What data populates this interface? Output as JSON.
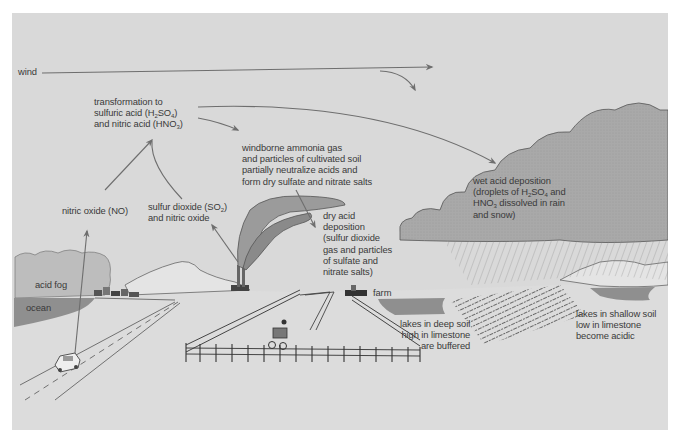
{
  "diagram": {
    "title": "Acid deposition",
    "colors": {
      "background": "#d9d9d9",
      "page": "#ffffff",
      "cloud": "#a9a9a9",
      "ocean": "#8f8f8f",
      "smoke": "#9b9b9b",
      "text": "#3a3a3a",
      "arrow": "#6e6e6e"
    },
    "labels": {
      "wind": "wind",
      "transformation": {
        "line1": "transformation to",
        "line2_pre": "sulfuric acid (H",
        "line2_sub1": "2",
        "line2_mid": "SO",
        "line2_sub2": "4",
        "line2_post": ")",
        "line3_pre": "and nitric acid (HNO",
        "line3_sub": "3",
        "line3_post": ")"
      },
      "ammonia": {
        "line1": "windborne ammonia gas",
        "line2": "and particles of cultivated soil",
        "line3": "partially neutralize acids and",
        "line4": "form dry sulfate and nitrate salts"
      },
      "wet_deposition": {
        "line1": "wet acid deposition",
        "line2_pre": "(droplets of H",
        "line2_sub1": "2",
        "line2_mid": "SO",
        "line2_sub2": "4",
        "line2_post": " and",
        "line3_pre": "HNO",
        "line3_sub": "3",
        "line3_post": " dissolved in rain",
        "line4": "and snow)"
      },
      "nitric_oxide": "nitric oxide (NO)",
      "sulfur_dioxide": {
        "line1_pre": "sulfur dioxide (SO",
        "line1_sub": "2",
        "line1_post": ")",
        "line2": "and nitric oxide"
      },
      "dry_deposition": {
        "line1": "dry acid",
        "line2": "deposition",
        "line3": "(sulfur dioxide",
        "line4": "gas and particles",
        "line5": "of sulfate and",
        "line6": "nitrate salts)"
      },
      "acid_fog": "acid fog",
      "ocean": "ocean",
      "farm": "farm",
      "deep_lakes": {
        "line1": "lakes in deep soil",
        "line2": "high in limestone",
        "line3": "are buffered"
      },
      "shallow_lakes": {
        "line1": "lakes in shallow soil",
        "line2": "low in limestone",
        "line3": "become acidic"
      }
    },
    "icons": {
      "car": "car-icon",
      "tractor": "tractor-icon",
      "smokestack": "smokestack-icon",
      "cloud": "cloud-icon",
      "farmhouse": "farmhouse-icon",
      "town": "town-icon"
    }
  }
}
